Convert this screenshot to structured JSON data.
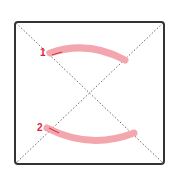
{
  "diagram": {
    "type": "gesture-strokes",
    "frame": {
      "x": 15,
      "y": 22,
      "width": 149,
      "height": 142,
      "color": "#333333"
    },
    "diagonals": {
      "color": "#666666",
      "style": "dotted"
    },
    "stroke_color": "#f4a6ae",
    "label_color": "#d9243a",
    "strokes": [
      {
        "label": "1",
        "path": "M50,53 Q88,40 125,60",
        "label_x": 40,
        "label_y": 56,
        "arrow": "M52,55 L62,52"
      },
      {
        "label": "2",
        "path": "M47,128 Q90,150 134,133",
        "label_x": 37,
        "label_y": 131,
        "arrow": "M49,128 L59,133"
      }
    ]
  }
}
